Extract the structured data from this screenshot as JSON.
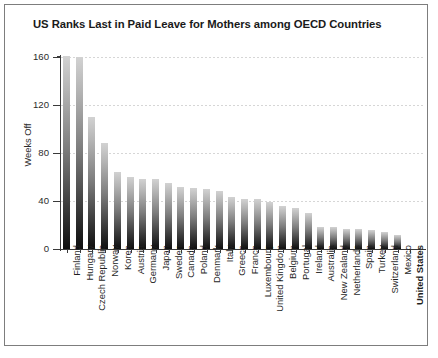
{
  "chart_data": {
    "type": "bar",
    "title": "US Ranks Last in Paid Leave for Mothers among OECD Countries",
    "xlabel": "",
    "ylabel": "Weeks Off",
    "ylim": [
      0,
      160
    ],
    "yticks": [
      0,
      40,
      80,
      120,
      160
    ],
    "grid": true,
    "legend": "none",
    "highlight_category": "United States",
    "categories": [
      "Finland",
      "Hungary",
      "Czech Republic",
      "Norway",
      "Korea",
      "Austria",
      "Germany",
      "Japan",
      "Sweden",
      "Canada",
      "Poland",
      "Denmark",
      "Italy",
      "Greece",
      "France",
      "Luxembourg",
      "United Kingdom",
      "Belgium",
      "Portugal",
      "Ireland",
      "Australia",
      "New Zealand",
      "Netherlands",
      "Spain",
      "Turkey",
      "Switzerland",
      "Mexico",
      "United States"
    ],
    "values": [
      161,
      160,
      110,
      88,
      64,
      60,
      58,
      58,
      55,
      52,
      51,
      50,
      48,
      43,
      42,
      42,
      39,
      36,
      34,
      30,
      18,
      18,
      17,
      17,
      16,
      14,
      12,
      0
    ]
  },
  "colors": {
    "bar_top": "#d2d2d2",
    "bar_bottom": "#0e0e0e",
    "axis": "#3a3a3a",
    "grid": "#d6d6d6",
    "text": "#1f1f1f",
    "background": "#ffffff",
    "border": "#7d7d7d"
  }
}
